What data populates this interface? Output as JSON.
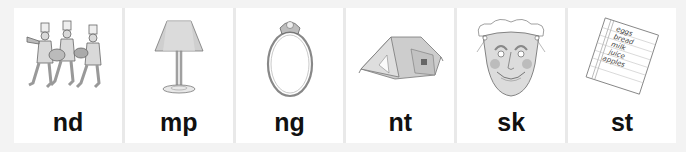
{
  "cards": [
    {
      "label": "nd",
      "picture": "marching-band",
      "word_hint": "band"
    },
    {
      "label": "mp",
      "picture": "lamp",
      "word_hint": "lamp"
    },
    {
      "label": "ng",
      "picture": "ring",
      "word_hint": "ring"
    },
    {
      "label": "nt",
      "picture": "tent",
      "word_hint": "tent"
    },
    {
      "label": "sk",
      "picture": "mask",
      "word_hint": "mask"
    },
    {
      "label": "st",
      "picture": "list",
      "word_hint": "list"
    }
  ],
  "list_items": [
    "eggs",
    "bread",
    "milk",
    "juice",
    "apples"
  ],
  "colors": {
    "background": "#f3f3f3",
    "gutter": "#e9e9e9",
    "card": "#ffffff",
    "label": "#111111"
  }
}
